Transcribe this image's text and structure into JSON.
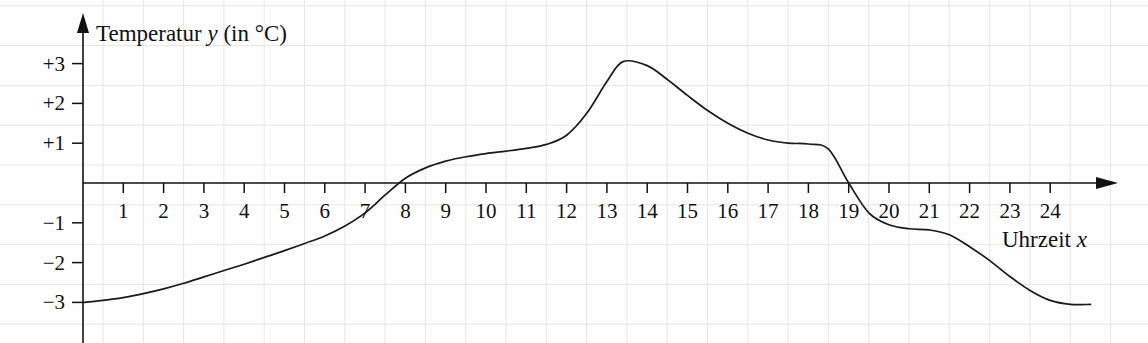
{
  "chart_data": {
    "type": "line",
    "title": "",
    "ylabel": "Temperatur y (in °C)",
    "xlabel": "Uhrzeit x",
    "y_axis_title_main": "Temperatur",
    "y_axis_title_var": "y",
    "y_axis_title_unit": "(in °C)",
    "x_axis_title_main": "Uhrzeit",
    "x_axis_title_var": "x",
    "xlim": [
      0,
      25.4
    ],
    "ylim": [
      -3.6,
      3.6
    ],
    "grid": true,
    "grid_color": "#e8e6e2",
    "line_color": "#1a1a1a",
    "axis_color": "#111111",
    "legend": "none",
    "x_tick_labels": [
      "1",
      "2",
      "3",
      "4",
      "5",
      "6",
      "7",
      "8",
      "9",
      "10",
      "11",
      "12",
      "13",
      "14",
      "15",
      "16",
      "17",
      "18",
      "19",
      "20",
      "21",
      "22",
      "23",
      "24"
    ],
    "x_tick_values": [
      1,
      2,
      3,
      4,
      5,
      6,
      7,
      8,
      9,
      10,
      11,
      12,
      13,
      14,
      15,
      16,
      17,
      18,
      19,
      20,
      21,
      22,
      23,
      24
    ],
    "y_tick_labels": [
      "+3",
      "+2",
      "+1",
      "−1",
      "−2",
      "−3"
    ],
    "y_tick_values": [
      3,
      2,
      1,
      -1,
      -2,
      -3
    ],
    "x": [
      0,
      0.5,
      1,
      1.5,
      2,
      2.5,
      3,
      3.5,
      4,
      4.5,
      5,
      5.5,
      6,
      6.5,
      7,
      7.5,
      8,
      8.5,
      9,
      9.5,
      10,
      10.5,
      11,
      11.5,
      12,
      12.5,
      13,
      13.4,
      14,
      14.5,
      15,
      15.5,
      16,
      16.5,
      17,
      17.5,
      18,
      18.5,
      19,
      19.5,
      20,
      20.5,
      21,
      21.5,
      22,
      22.5,
      23,
      23.5,
      24,
      24.5,
      25
    ],
    "values": [
      -3.0,
      -2.95,
      -2.88,
      -2.78,
      -2.66,
      -2.52,
      -2.36,
      -2.2,
      -2.04,
      -1.87,
      -1.7,
      -1.52,
      -1.33,
      -1.08,
      -0.75,
      -0.3,
      0.12,
      0.38,
      0.55,
      0.66,
      0.74,
      0.8,
      0.87,
      0.97,
      1.2,
      1.75,
      2.55,
      3.05,
      2.95,
      2.6,
      2.2,
      1.82,
      1.5,
      1.25,
      1.08,
      1.0,
      0.98,
      0.85,
      0.0,
      -0.75,
      -1.05,
      -1.15,
      -1.18,
      -1.3,
      -1.6,
      -1.95,
      -2.35,
      -2.7,
      -2.95,
      -3.05,
      -3.05
    ]
  }
}
